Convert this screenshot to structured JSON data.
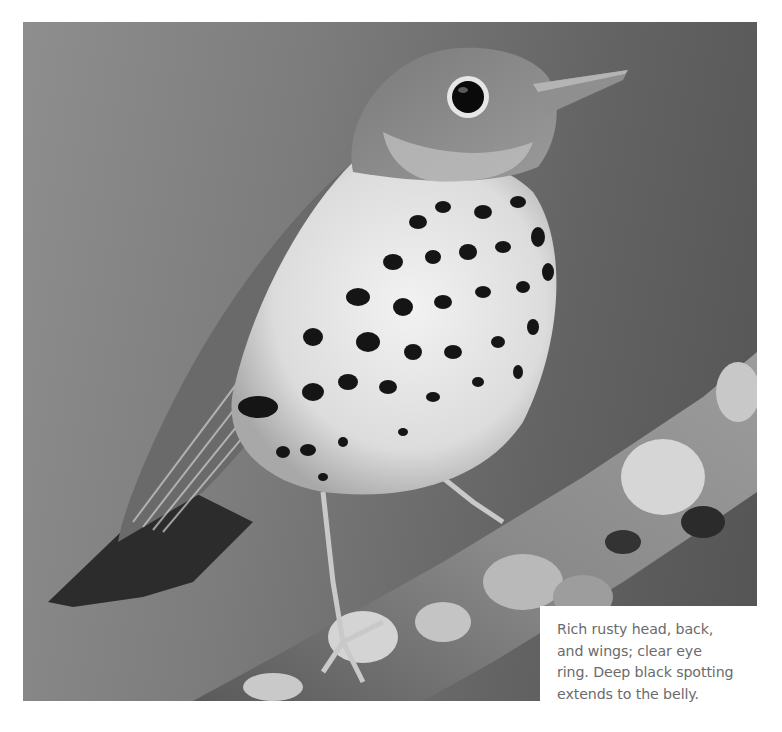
{
  "photo": {
    "subject": "Wood Thrush perched on a lichen-covered branch",
    "tone": "grayscale",
    "colors": {
      "background_light": "#8e8e8e",
      "background_dark": "#545454",
      "breast": "#ececec",
      "spots": "#151515",
      "back": "#6e6e6e",
      "branch": "#7a7a7a",
      "lichen": "#d8d8d8"
    }
  },
  "caption": {
    "text": "Rich rusty head, back,\nand wings; clear eye\nring. Deep black spotting\nextends to the belly.",
    "color": "#6b6b6b"
  }
}
